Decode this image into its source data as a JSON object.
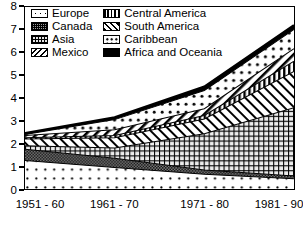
{
  "chart_data": {
    "type": "area",
    "title": "",
    "xlabel": "",
    "ylabel": "",
    "categories": [
      "1951 - 60",
      "1961 - 70",
      "1971 - 80",
      "1981 - 90"
    ],
    "ylim": [
      0,
      8
    ],
    "yticks": [
      0,
      1,
      2,
      3,
      4,
      5,
      6,
      7,
      8
    ],
    "grid": false,
    "stacked": true,
    "legend_position": "top-left-inside",
    "legend": [
      "Europe",
      "Canada",
      "Asia",
      "Mexico",
      "Central America",
      "South America",
      "Caribbean",
      "Africa and Oceania"
    ],
    "series": [
      {
        "name": "Europe",
        "values": [
          1.25,
          0.95,
          0.65,
          0.45
        ]
      },
      {
        "name": "Canada",
        "values": [
          0.5,
          0.4,
          0.18,
          0.12
        ]
      },
      {
        "name": "Asia",
        "values": [
          0.15,
          0.45,
          1.6,
          3.0
        ]
      },
      {
        "name": "Mexico",
        "values": [
          0.3,
          0.45,
          0.65,
          1.6
        ]
      },
      {
        "name": "Central America",
        "values": [
          0.05,
          0.1,
          0.15,
          0.45
        ]
      },
      {
        "name": "South America",
        "values": [
          0.1,
          0.25,
          0.3,
          0.55
        ]
      },
      {
        "name": "Caribbean",
        "values": [
          0.05,
          0.45,
          0.8,
          0.85
        ]
      },
      {
        "name": "Africa and Oceania",
        "values": [
          0.05,
          0.1,
          0.17,
          0.18
        ]
      }
    ],
    "totals": [
      2.45,
      3.15,
      4.5,
      7.2
    ]
  },
  "axes": {
    "y_tick_labels": [
      "8",
      "7",
      "6",
      "5",
      "4",
      "3",
      "2",
      "1",
      "0"
    ],
    "x_tick_labels": [
      "1951 - 60",
      "1961 - 70",
      "1971 - 80",
      "1981 - 90"
    ]
  },
  "legend": {
    "column_left": [
      {
        "label": "Europe",
        "swatch": "sparse-dots-pattern"
      },
      {
        "label": "Canada",
        "swatch": "dense-checker-pattern"
      },
      {
        "label": "Asia",
        "swatch": "fine-grid-pattern"
      },
      {
        "label": "Mexico",
        "swatch": "diagonal-hatch-pattern"
      }
    ],
    "column_right": [
      {
        "label": "Central America",
        "swatch": "vertical-stripe-pattern"
      },
      {
        "label": "South America",
        "swatch": "diagonal-stripe-pattern"
      },
      {
        "label": "Caribbean",
        "swatch": "open-dots-pattern"
      },
      {
        "label": "Africa and Oceania",
        "swatch": "solid-black-fill"
      }
    ]
  },
  "colors": {
    "ink": "#000000",
    "paper": "#ffffff",
    "canada_fill": "#9a9a9a",
    "asia_fill": "#e4e4e4"
  }
}
